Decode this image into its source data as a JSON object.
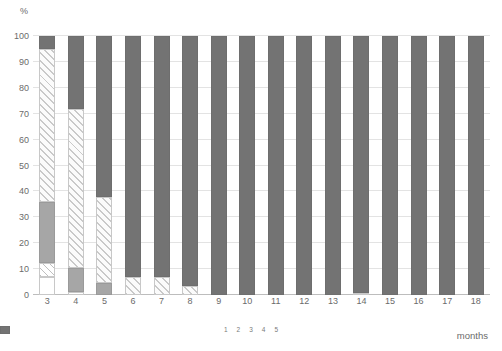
{
  "chart_data": {
    "type": "bar",
    "stacked": true,
    "title": "",
    "xlabel": "months",
    "ylabel": "%",
    "ylim": [
      0,
      100
    ],
    "ytick_labels": [
      "0",
      "10",
      "20",
      "30",
      "40",
      "50",
      "60",
      "70",
      "80",
      "90",
      "100"
    ],
    "ytick_values": [
      0,
      10,
      20,
      30,
      40,
      50,
      60,
      70,
      80,
      90,
      100
    ],
    "grid": true,
    "legend_position": "bottom-center",
    "categories": [
      "3",
      "4",
      "5",
      "6",
      "7",
      "8",
      "9",
      "10",
      "11",
      "12",
      "13",
      "14",
      "15",
      "16",
      "17",
      "18"
    ],
    "series": [
      {
        "name": "1",
        "values": [
          7.0,
          1.0,
          0.0,
          0.0,
          0.0,
          0.0,
          0.0,
          0.0,
          0.0,
          0.0,
          0.0,
          0.7,
          0.0,
          0.0,
          0.0,
          0.0
        ]
      },
      {
        "name": "2",
        "values": [
          5.5,
          0.0,
          0.0,
          0.0,
          0.0,
          0.0,
          0.0,
          0.0,
          0.0,
          0.0,
          0.0,
          0.0,
          0.0,
          0.0,
          0.0,
          0.0
        ]
      },
      {
        "name": "3",
        "values": [
          23.5,
          9.5,
          4.5,
          0.0,
          0.0,
          0.0,
          0.0,
          0.0,
          0.0,
          0.0,
          0.0,
          0.0,
          0.0,
          0.0,
          0.0,
          0.0
        ]
      },
      {
        "name": "4",
        "values": [
          59.0,
          61.5,
          33.5,
          7.0,
          7.0,
          3.5,
          0.0,
          0.0,
          0.0,
          0.0,
          0.0,
          0.0,
          0.0,
          0.0,
          0.0,
          0.0
        ]
      },
      {
        "name": "5",
        "values": [
          5.0,
          28.0,
          62.0,
          93.0,
          93.0,
          96.5,
          100.0,
          100.0,
          100.0,
          100.0,
          100.0,
          99.3,
          100.0,
          100.0,
          100.0,
          100.0
        ]
      }
    ],
    "legend_entries": [
      {
        "label": "1",
        "style": "blank"
      },
      {
        "label": "2",
        "style": "light-hatch"
      },
      {
        "label": "3",
        "style": "solid-gray"
      },
      {
        "label": "4",
        "style": "dense-hatch"
      },
      {
        "label": "5",
        "style": "solid-dark-gray"
      }
    ],
    "colors": {
      "c1": "#ffffff",
      "c2": "#bfbfbf",
      "c3": "#a6a6a6",
      "c4": "#c9c9c9",
      "c5": "#737373",
      "gridline": "#e3e3e3",
      "axis_text": "#6b6b6b"
    }
  }
}
